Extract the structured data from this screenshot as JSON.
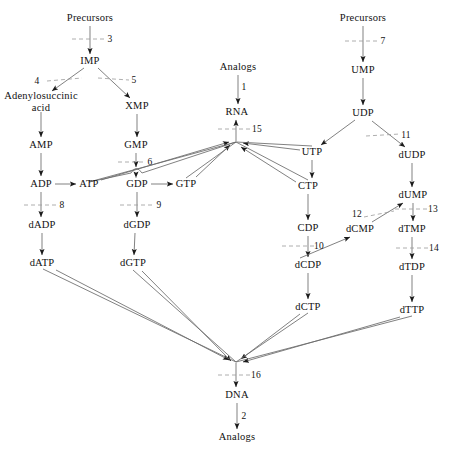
{
  "diagram": {
    "stroke_color": "#555555",
    "text_color": "#111111",
    "background": "#ffffff",
    "nodes": [
      {
        "id": "precursors_a",
        "label": "Precursors",
        "x": 90,
        "y": 18
      },
      {
        "id": "imp",
        "label": "IMP",
        "x": 90,
        "y": 61
      },
      {
        "id": "adenylosuccinic",
        "label": "Adenylosuccinic\nacid",
        "x": 41,
        "y": 101
      },
      {
        "id": "xmp",
        "label": "XMP",
        "x": 137,
        "y": 106
      },
      {
        "id": "amp",
        "label": "AMP",
        "x": 41,
        "y": 145
      },
      {
        "id": "gmp",
        "label": "GMP",
        "x": 136,
        "y": 145
      },
      {
        "id": "adp",
        "label": "ADP",
        "x": 41,
        "y": 184
      },
      {
        "id": "atp",
        "label": "ATP",
        "x": 89,
        "y": 184
      },
      {
        "id": "gdp",
        "label": "GDP",
        "x": 137,
        "y": 184
      },
      {
        "id": "gtp",
        "label": "GTP",
        "x": 186,
        "y": 184
      },
      {
        "id": "dadp",
        "label": "dADP",
        "x": 42,
        "y": 225
      },
      {
        "id": "dgdp",
        "label": "dGDP",
        "x": 137,
        "y": 225
      },
      {
        "id": "datp",
        "label": "dATP",
        "x": 42,
        "y": 263
      },
      {
        "id": "dgtp",
        "label": "dGTP",
        "x": 133,
        "y": 263
      },
      {
        "id": "analogs_top",
        "label": "Analogs",
        "x": 238,
        "y": 67
      },
      {
        "id": "rna",
        "label": "RNA",
        "x": 237,
        "y": 112
      },
      {
        "id": "utp",
        "label": "UTP",
        "x": 312,
        "y": 152
      },
      {
        "id": "ctp",
        "label": "CTP",
        "x": 308,
        "y": 186
      },
      {
        "id": "cdp",
        "label": "CDP",
        "x": 308,
        "y": 228
      },
      {
        "id": "dcdp",
        "label": "dCDP",
        "x": 308,
        "y": 265
      },
      {
        "id": "dctp",
        "label": "dCTP",
        "x": 308,
        "y": 307
      },
      {
        "id": "precursors_b",
        "label": "Precursors",
        "x": 363,
        "y": 18
      },
      {
        "id": "ump",
        "label": "UMP",
        "x": 363,
        "y": 70
      },
      {
        "id": "udp",
        "label": "UDP",
        "x": 363,
        "y": 113
      },
      {
        "id": "dudp",
        "label": "dUDP",
        "x": 412,
        "y": 155
      },
      {
        "id": "dump",
        "label": "dUMP",
        "x": 413,
        "y": 195
      },
      {
        "id": "dcmp",
        "label": "dCMP",
        "x": 360,
        "y": 229
      },
      {
        "id": "dtmp",
        "label": "dTMP",
        "x": 412,
        "y": 229
      },
      {
        "id": "dtdp",
        "label": "dTDP",
        "x": 412,
        "y": 267
      },
      {
        "id": "dttp",
        "label": "dTTP",
        "x": 412,
        "y": 310
      },
      {
        "id": "dna",
        "label": "DNA",
        "x": 237,
        "y": 395
      },
      {
        "id": "analogs_bottom",
        "label": "Analogs",
        "x": 237,
        "y": 437
      }
    ],
    "step_labels": [
      {
        "id": "step-3",
        "label": "3",
        "x": 110,
        "y": 39
      },
      {
        "id": "step-4",
        "label": "4",
        "x": 37,
        "y": 81
      },
      {
        "id": "step-5",
        "label": "5",
        "x": 134,
        "y": 80
      },
      {
        "id": "step-7",
        "label": "7",
        "x": 383,
        "y": 41
      },
      {
        "id": "step-1",
        "label": "1",
        "x": 244,
        "y": 87
      },
      {
        "id": "step-15",
        "label": "15",
        "x": 257,
        "y": 129
      },
      {
        "id": "step-11",
        "label": "11",
        "x": 406,
        "y": 135
      },
      {
        "id": "step-6",
        "label": "6",
        "x": 150,
        "y": 162
      },
      {
        "id": "step-8",
        "label": "8",
        "x": 62,
        "y": 205
      },
      {
        "id": "step-9",
        "label": "9",
        "x": 159,
        "y": 205
      },
      {
        "id": "step-13",
        "label": "13",
        "x": 433,
        "y": 209
      },
      {
        "id": "step-12",
        "label": "12",
        "x": 357,
        "y": 214
      },
      {
        "id": "step-10",
        "label": "10",
        "x": 319,
        "y": 246
      },
      {
        "id": "step-14",
        "label": "14",
        "x": 434,
        "y": 248
      },
      {
        "id": "step-16",
        "label": "16",
        "x": 256,
        "y": 375
      },
      {
        "id": "step-2",
        "label": "2",
        "x": 244,
        "y": 416
      }
    ]
  }
}
